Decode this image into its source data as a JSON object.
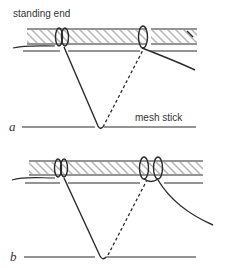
{
  "figure": {
    "labels": {
      "standing_end": "standing end",
      "mesh_stick": "mesh stick",
      "panel_a": "a",
      "panel_b": "b"
    },
    "panels": [
      {
        "id": "a",
        "description": "Netting knot step a: twine passes around foundation cord and mesh stick, single hitch on the right"
      },
      {
        "id": "b",
        "description": "Netting knot step b: twine forms double loop (sheet bend) on foundation cord"
      }
    ],
    "colors": {
      "line": "#2a2a2a",
      "background": "#ffffff"
    }
  }
}
